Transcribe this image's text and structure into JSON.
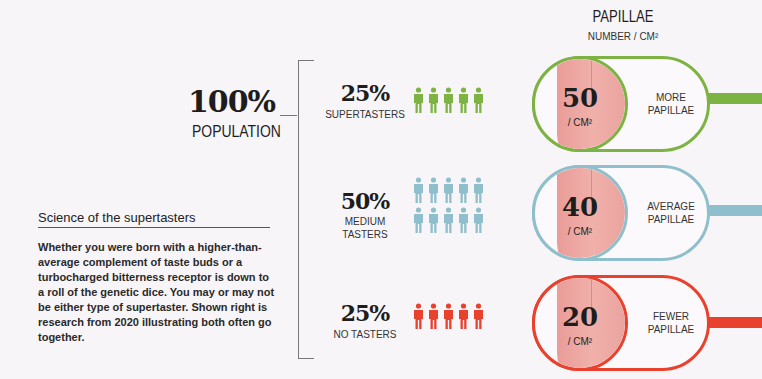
{
  "population": {
    "percent": "100%",
    "label": "POPULATION"
  },
  "header": {
    "title": "PAPILLAE",
    "subtitle": "NUMBER / CM²"
  },
  "groups": [
    {
      "percent": "25%",
      "label": "SUPERTASTERS",
      "icon_count": 5,
      "icon": "person-icon",
      "color": "#7cb342",
      "papillae": {
        "value": "50",
        "unit": "/ CM²",
        "label_line1": "MORE",
        "label_line2": "PAPILLAE"
      }
    },
    {
      "percent": "50%",
      "label_line1": "MEDIUM",
      "label_line2": "TASTERS",
      "icon_count": 10,
      "icon": "person-icon",
      "color": "#8fbfcc",
      "papillae": {
        "value": "40",
        "unit": "/ CM²",
        "label_line1": "AVERAGE",
        "label_line2": "PAPILLAE"
      }
    },
    {
      "percent": "25%",
      "label": "NO TASTERS",
      "icon_count": 5,
      "icon": "person-icon",
      "color": "#e8412e",
      "papillae": {
        "value": "20",
        "unit": "/ CM²",
        "label_line1": "FEWER",
        "label_line2": "PAPILLAE"
      }
    }
  ],
  "sidebar": {
    "title": "Science of the supertasters",
    "body": "Whether you were born with a higher-than-average complement of taste buds or a turbocharged bitterness receptor is down to a roll of the genetic dice. You may or may not be either type of supertaster. Shown right is research from 2020 illustrating both often go together."
  }
}
